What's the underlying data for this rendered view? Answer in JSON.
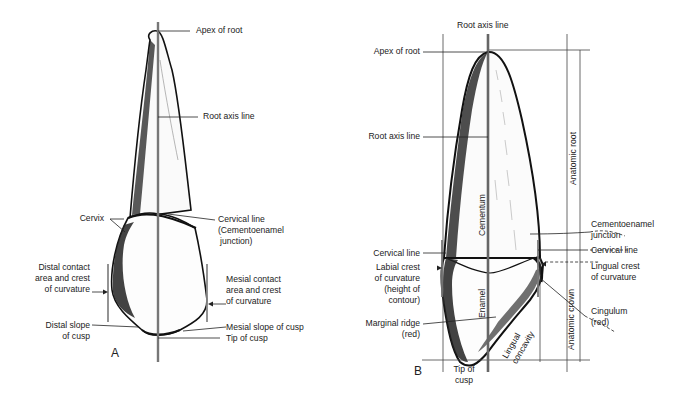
{
  "figure": {
    "panel_a": {
      "letter": "A",
      "labels": {
        "apex_of_root": "Apex of root",
        "root_axis_line": "Root axis line",
        "cervix": "Cervix",
        "cervical_line_1": "Cervical line",
        "cervical_line_2": "(Cementoenamel",
        "cervical_line_3": "junction)",
        "distal_contact_1": "Distal contact",
        "distal_contact_2": "area and crest",
        "distal_contact_3": "of curvature",
        "mesial_contact_1": "Mesial contact",
        "mesial_contact_2": "area and crest",
        "mesial_contact_3": "of curvature",
        "distal_slope_1": "Distal slope",
        "distal_slope_2": "of cusp",
        "mesial_slope": "Mesial slope of cusp",
        "tip_of_cusp": "Tip of cusp"
      }
    },
    "panel_b": {
      "letter": "B",
      "labels": {
        "root_axis_line_top": "Root axis line",
        "apex_of_root": "Apex of root",
        "root_axis_line": "Root axis line",
        "cementum": "Cementum",
        "anatomic_root": "Anatomic root",
        "cej_1": "Cementoenamel",
        "cej_2": "junction",
        "cervical_line_left": "Cervical line",
        "cervical_line_right": "Cervical line",
        "labial_crest_1": "Labial crest",
        "labial_crest_2": "of curvature",
        "labial_crest_3": "(height of",
        "labial_crest_4": "contour)",
        "lingual_crest_1": "Lingual crest",
        "lingual_crest_2": "of curvature",
        "enamel": "Enamel",
        "anatomic_crown": "Anatomic crown",
        "cingulum_1": "Cingulum",
        "cingulum_2": "(red)",
        "marginal_ridge_1": "Marginal ridge",
        "marginal_ridge_2": "(red)",
        "lingual_concavity_1": "Lingual",
        "lingual_concavity_2": "concavity",
        "tip_of_cusp_1": "Tip of",
        "tip_of_cusp_2": "cusp"
      }
    }
  }
}
